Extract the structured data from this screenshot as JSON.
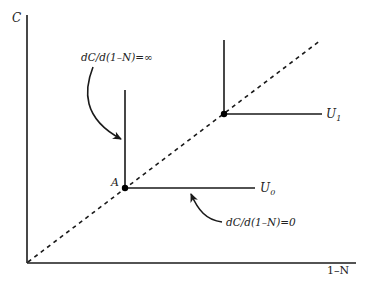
{
  "diagram": {
    "type": "indifference-curves-perfect-complements",
    "axes": {
      "y_label": "C",
      "x_label": "1–N"
    },
    "colors": {
      "line": "#1a1a1a",
      "text": "#222222",
      "background": "#ffffff"
    },
    "ray": {
      "style": "dashed",
      "description": "45-degree line from origin through kink points"
    },
    "curves": [
      {
        "id": "U0",
        "label_main": "U",
        "label_sub": "0",
        "kink_point_label": "A"
      },
      {
        "id": "U1",
        "label_main": "U",
        "label_sub": "1",
        "kink_point_label": ""
      }
    ],
    "annotations": [
      {
        "id": "vertical-slope",
        "text": "dC/d(1–N)=∞",
        "target": "vertical segment of U0"
      },
      {
        "id": "horizontal-slope",
        "text": "dC/d(1–N)=0",
        "target": "horizontal segment of U0"
      }
    ]
  }
}
